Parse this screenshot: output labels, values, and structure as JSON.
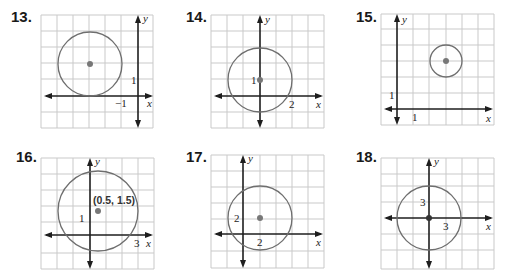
{
  "colors": {
    "grid": "#c9c9c9",
    "axis": "#1e1e1e",
    "circle": "#6e6e6e",
    "center_dot": "#777777",
    "number": "#1a1a1a"
  },
  "problems": [
    {
      "number": "13.",
      "center": [
        -3,
        2
      ],
      "radius": 2,
      "tick_labels": [
        {
          "text": "1",
          "axis": "y",
          "value": 1
        },
        {
          "text": "−1",
          "axis": "x",
          "value": -1
        }
      ],
      "x_label": "x",
      "y_label": "y"
    },
    {
      "number": "14.",
      "center": [
        0,
        1
      ],
      "radius": 2,
      "tick_labels": [
        {
          "text": "1",
          "axis": "y",
          "value": 1
        },
        {
          "text": "2",
          "axis": "x",
          "value": 2
        }
      ],
      "x_label": "x",
      "y_label": "y"
    },
    {
      "number": "15.",
      "center": [
        3,
        3
      ],
      "radius": 1,
      "tick_labels": [
        {
          "text": "1",
          "axis": "y",
          "value": 1
        },
        {
          "text": "1",
          "axis": "x",
          "value": 1
        }
      ],
      "x_label": "x",
      "y_label": "y"
    },
    {
      "number": "16.",
      "center": [
        0.5,
        1.5
      ],
      "radius": 2.5,
      "center_label": "(0.5, 1.5)",
      "tick_labels": [
        {
          "text": "1",
          "axis": "y",
          "value": 1
        },
        {
          "text": "3",
          "axis": "x",
          "value": 3
        }
      ],
      "x_label": "x",
      "y_label": "y"
    },
    {
      "number": "17.",
      "center": [
        1,
        1
      ],
      "radius": 2,
      "tick_labels": [
        {
          "text": "2",
          "axis": "y",
          "value": 1
        },
        {
          "text": "2",
          "axis": "x",
          "value": 1
        }
      ],
      "x_label": "x",
      "y_label": "y"
    },
    {
      "number": "18.",
      "center": [
        0,
        0
      ],
      "radius": 2,
      "tick_labels": [
        {
          "text": "3",
          "axis": "y",
          "value": 1
        },
        {
          "text": "3",
          "axis": "x",
          "value": 1
        }
      ],
      "x_label": "x",
      "y_label": "y"
    }
  ]
}
